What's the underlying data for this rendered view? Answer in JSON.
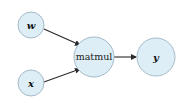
{
  "diagram": {
    "type": "computational-graph",
    "nodes": [
      {
        "id": "w",
        "label": "w",
        "italic": true
      },
      {
        "id": "x",
        "label": "x",
        "italic": true
      },
      {
        "id": "matmul",
        "label": "matmul",
        "italic": false
      },
      {
        "id": "y",
        "label": "y",
        "italic": true
      }
    ],
    "edges": [
      {
        "from": "w",
        "to": "matmul"
      },
      {
        "from": "x",
        "to": "matmul"
      },
      {
        "from": "matmul",
        "to": "y"
      }
    ],
    "colors": {
      "node_fill": "#ddeef7",
      "node_stroke": "#9cb3c2",
      "edge": "#2a2a2a"
    }
  }
}
